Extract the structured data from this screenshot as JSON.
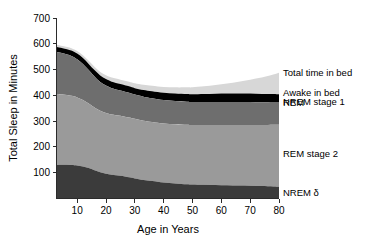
{
  "figure": {
    "background": "#ffffff"
  },
  "chart_data": {
    "type": "area",
    "title": "",
    "subtitle": "",
    "xlabel": "Age in Years",
    "ylabel": "Total Sleep in Minutes",
    "xlim": [
      3,
      80
    ],
    "ylim": [
      0,
      700
    ],
    "xticks": [
      10,
      20,
      30,
      40,
      50,
      60,
      70,
      80
    ],
    "yticks": [
      100,
      200,
      300,
      400,
      500,
      600,
      700
    ],
    "grid": false,
    "stacked": true,
    "legend_position": "right-inline",
    "x": [
      3,
      5,
      8,
      10,
      12,
      14,
      16,
      18,
      20,
      22,
      25,
      28,
      30,
      33,
      36,
      40,
      44,
      48,
      50,
      54,
      58,
      62,
      66,
      70,
      74,
      78,
      80
    ],
    "series": [
      {
        "name": "NREM δ",
        "label": "NREM δ",
        "color": "#3b3b3b",
        "values": [
          130,
          131,
          130,
          128,
          124,
          118,
          110,
          102,
          96,
          92,
          88,
          82,
          78,
          72,
          68,
          62,
          58,
          55,
          54,
          53,
          52,
          51,
          50,
          49,
          48,
          47,
          46
        ]
      },
      {
        "name": "REM stage 2",
        "label": "REM stage 2",
        "color": "#9a9a9a",
        "values": [
          275,
          272,
          268,
          264,
          258,
          250,
          243,
          238,
          236,
          234,
          233,
          232,
          231,
          230,
          229,
          229,
          230,
          231,
          231,
          232,
          233,
          234,
          235,
          236,
          237,
          239,
          240
        ]
      },
      {
        "name": "REM",
        "label": "REM",
        "color": "#6e6e6e",
        "values": [
          163,
          160,
          155,
          148,
          140,
          130,
          120,
          112,
          106,
          102,
          98,
          96,
          94,
          93,
          92,
          91,
          90,
          89,
          89,
          89,
          89,
          89,
          89,
          89,
          88,
          88,
          88
        ]
      },
      {
        "name": "NREM stage 1",
        "label": "NREM stage 1",
        "color": "#000000",
        "values": [
          20,
          20,
          21,
          22,
          23,
          24,
          25,
          25,
          25,
          25,
          25,
          25,
          25,
          26,
          27,
          28,
          29,
          30,
          30,
          31,
          32,
          33,
          33,
          33,
          32,
          31,
          30
        ]
      },
      {
        "name": "Awake in bed",
        "label": "Awake in bed",
        "color": "#d7d7d7",
        "values": [
          8,
          8,
          9,
          10,
          11,
          12,
          13,
          14,
          15,
          16,
          17,
          18,
          19,
          20,
          21,
          22,
          24,
          26,
          27,
          30,
          34,
          39,
          46,
          54,
          64,
          76,
          84
        ]
      }
    ],
    "top_line": {
      "name": "Total time in bed",
      "label": "Total time in bed",
      "color": "#d7d7d7"
    },
    "legend_entries": [
      {
        "label": "Total time in bed"
      },
      {
        "label": "Awake in bed"
      },
      {
        "label": "NREM stage 1"
      },
      {
        "label": "REM"
      },
      {
        "label": "REM stage 2"
      },
      {
        "label": "NREM δ"
      }
    ]
  }
}
